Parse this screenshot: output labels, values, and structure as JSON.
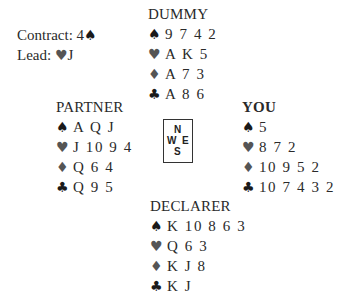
{
  "info": {
    "contract_label": "Contract: 4",
    "contract_suit": "♠",
    "lead_label": "Lead: ",
    "lead_suit": "♥",
    "lead_card": "J"
  },
  "compass": {
    "north": "N",
    "west": "W",
    "east": "E",
    "south": "S"
  },
  "suit_symbols": {
    "spades": "♠",
    "hearts": "♥",
    "diamonds": "♦",
    "clubs": "♣"
  },
  "colors": {
    "black_suits": "#1a1a1a",
    "red_suits_rendered": "#555555",
    "text": "#2a2a2a"
  },
  "hands": {
    "dummy": {
      "title": "DUMMY",
      "spades": "9 7 4 2",
      "hearts": "A K 5",
      "diamonds": "A 7 3",
      "clubs": "A 8 6"
    },
    "partner": {
      "title": "PARTNER",
      "spades": "A Q J",
      "hearts": "J 10 9 4",
      "diamonds": "Q 6 4",
      "clubs": "Q 9 5"
    },
    "you": {
      "title": "YOU",
      "spades": "5",
      "hearts": "8 7 2",
      "diamonds": "10 9 5 2",
      "clubs": "10 7 4 3 2"
    },
    "declarer": {
      "title": "DECLARER",
      "spades": "K 10 8 6 3",
      "hearts": "Q 6 3",
      "diamonds": "K J 8",
      "clubs": "K J"
    }
  }
}
